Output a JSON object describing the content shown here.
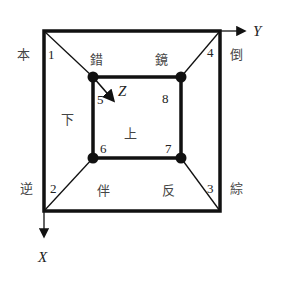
{
  "diagram": {
    "axes": {
      "x": "X",
      "y": "Y",
      "z": "Z"
    },
    "nodes": [
      {
        "id": "1",
        "label": "1"
      },
      {
        "id": "2",
        "label": "2"
      },
      {
        "id": "3",
        "label": "3"
      },
      {
        "id": "4",
        "label": "4"
      },
      {
        "id": "5",
        "label": "5"
      },
      {
        "id": "6",
        "label": "6"
      },
      {
        "id": "7",
        "label": "7"
      },
      {
        "id": "8",
        "label": "8"
      }
    ],
    "outer_labels": {
      "top_left": "本",
      "top_right": "倒",
      "bottom_left": "逆",
      "bottom_right": "綜"
    },
    "region_labels": {
      "top_left": "錯",
      "top_right": "鏡",
      "left": "下",
      "center": "上",
      "bottom_left": "伴",
      "bottom_right": "反"
    },
    "colors": {
      "line": "#111111",
      "text": "#333333",
      "background": "#ffffff"
    }
  }
}
